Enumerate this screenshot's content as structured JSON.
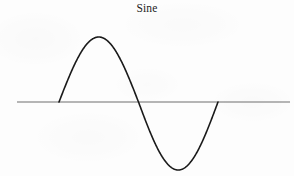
{
  "figure": {
    "title": "Sine",
    "width": 294,
    "height": 176,
    "background_color": "#fdfdfd",
    "axis_color": "#6e6e6e",
    "curve_color": "#1a1a1a"
  },
  "chart_data": {
    "type": "line",
    "title": "Sine",
    "subtitle": "",
    "xlabel": "",
    "ylabel": "",
    "grid": false,
    "legend": null,
    "axis": {
      "horizontal_axis_visible": true,
      "vertical_axis_visible": false,
      "axis_y_pixel": 102,
      "axis_x_start_pixel": 17,
      "axis_x_end_pixel": 290
    },
    "xlim": [
      0,
      6.283185
    ],
    "ylim": [
      -1,
      1
    ],
    "xticks": [],
    "yticks": [],
    "series": [
      {
        "name": "sine",
        "function": "sin(x)",
        "amplitude": 1,
        "period": 6.283185,
        "phase": 0,
        "zero_crossings_pixel_x": [
          59,
          137,
          218
        ],
        "peak_pixel": [
          96,
          37
        ],
        "trough_pixel": [
          178,
          170
        ],
        "x": [
          0.0,
          0.25,
          0.5,
          0.75,
          1.0,
          1.25,
          1.5,
          1.75,
          2.0,
          2.25,
          2.5,
          2.75,
          3.0,
          3.141593,
          3.25,
          3.5,
          3.75,
          4.0,
          4.25,
          4.5,
          4.75,
          5.0,
          5.25,
          5.5,
          5.75,
          6.0,
          6.283185
        ],
        "y": [
          0.0,
          0.247,
          0.479,
          0.682,
          0.841,
          0.949,
          0.997,
          0.984,
          0.909,
          0.778,
          0.599,
          0.382,
          0.141,
          0.0,
          -0.108,
          -0.351,
          -0.572,
          -0.757,
          -0.895,
          -0.978,
          -0.999,
          -0.959,
          -0.861,
          -0.706,
          -0.501,
          -0.279,
          0.0
        ]
      }
    ]
  }
}
